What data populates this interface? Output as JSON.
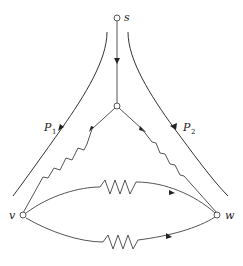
{
  "diagram": {
    "type": "network-flow-resistor-graph",
    "nodes": [
      {
        "id": "s",
        "label": "s"
      },
      {
        "id": "m",
        "label": ""
      },
      {
        "id": "v",
        "label": "v"
      },
      {
        "id": "w",
        "label": "w"
      }
    ],
    "edges": [
      {
        "from": "s",
        "to": "m",
        "kind": "directed"
      },
      {
        "from": "m",
        "to": "v",
        "kind": "resistor",
        "directed": true
      },
      {
        "from": "m",
        "to": "w",
        "kind": "resistor",
        "directed": true
      },
      {
        "from": "w",
        "to": "v",
        "kind": "resistor",
        "directed": true,
        "position": "upper arc"
      },
      {
        "from": "v",
        "to": "w",
        "kind": "resistor",
        "directed": true,
        "position": "lower arc"
      }
    ],
    "paths": [
      {
        "id": "P1",
        "label": "P",
        "subscript": "1",
        "side": "left"
      },
      {
        "id": "P2",
        "label": "P",
        "subscript": "2",
        "side": "right"
      }
    ],
    "colors": {
      "stroke": "#555555",
      "arrow": "#222222",
      "background": "#ffffff"
    }
  }
}
